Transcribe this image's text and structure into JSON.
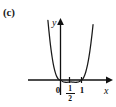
{
  "figure": {
    "part_label": "(c)",
    "axes": {
      "x_label": "x",
      "y_label": "y",
      "x_axis_arrow": true,
      "y_axis_arrow": true
    },
    "ticks": {
      "zero": "0",
      "half_numerator": "1",
      "half_denominator": "2",
      "one": "1"
    },
    "colors": {
      "ink": "#111111",
      "curve": "#1a1a1a",
      "background": "#ffffff"
    }
  },
  "chart_data": {
    "type": "line",
    "title": "(c)",
    "xlabel": "x",
    "ylabel": "y",
    "grid": false,
    "legend": null,
    "xlim": [
      -0.62,
      1.62
    ],
    "ylim": [
      -0.06,
      0.33
    ],
    "tick_labels_x": [
      "0",
      "1/2",
      "1"
    ],
    "tick_values_x": [
      0,
      0.5,
      1
    ],
    "tick_labels_y": [],
    "annotations": [],
    "series": [
      {
        "name": "y = x^2 (x - 1)^2 - small",
        "x": [
          -0.6,
          -0.55,
          -0.5,
          -0.45,
          -0.4,
          -0.35,
          -0.3,
          -0.25,
          -0.2,
          -0.15,
          -0.1,
          -0.05,
          0.0,
          0.1,
          0.2,
          0.3,
          0.4,
          0.5,
          0.6,
          0.7,
          0.8,
          0.9,
          1.0,
          1.05,
          1.1,
          1.15,
          1.2,
          1.25,
          1.3,
          1.35,
          1.4,
          1.45,
          1.5,
          1.55,
          1.6
        ],
        "y": [
          0.33,
          0.27,
          0.215,
          0.168,
          0.127,
          0.092,
          0.064,
          0.042,
          0.025,
          0.013,
          0.005,
          0.001,
          0.0,
          -0.008,
          -0.012,
          -0.013,
          -0.012,
          -0.011,
          -0.012,
          -0.013,
          -0.012,
          -0.008,
          0.0,
          0.004,
          0.013,
          0.026,
          0.043,
          0.065,
          0.092,
          0.124,
          0.161,
          0.204,
          0.252,
          0.306,
          0.366
        ]
      }
    ]
  }
}
